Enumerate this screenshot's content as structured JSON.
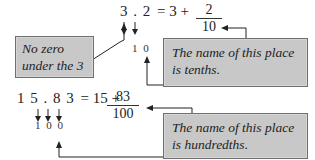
{
  "example1": {
    "digits": [
      "3",
      ".",
      "2"
    ],
    "equation": "= 3 +",
    "fraction": {
      "numerator": "2",
      "denominator": "10"
    },
    "place_digits": [
      "1",
      "0"
    ],
    "note_left": {
      "line1": "No zero",
      "line2": "under the 3"
    },
    "note_right": {
      "line1": "The name of this place",
      "line2": "is tenths."
    }
  },
  "example2": {
    "digits": [
      "1",
      "5",
      ".",
      "8",
      "3"
    ],
    "equation": "= 15 +",
    "fraction": {
      "numerator": "83",
      "denominator": "100"
    },
    "place_digits": [
      "1",
      "0",
      "0"
    ],
    "note_right": {
      "line1": "The name of this place",
      "line2": "is hundredths."
    }
  },
  "colors": {
    "box_fill": "#c8c8c8",
    "box_border": "#6f6f6f",
    "line": "#222222"
  }
}
